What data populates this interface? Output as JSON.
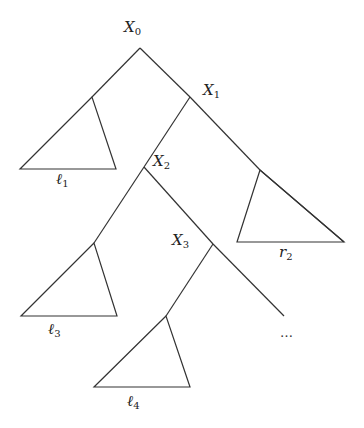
{
  "diagram": {
    "type": "tree",
    "stroke_color": "#333333",
    "nodes": [
      {
        "id": "X0",
        "base": "X",
        "sub": "0",
        "x": 140,
        "y": 48,
        "label_x": 124,
        "label_y": 20
      },
      {
        "id": "X1",
        "base": "X",
        "sub": "1",
        "x": 190,
        "y": 97,
        "label_x": 203,
        "label_y": 83
      },
      {
        "id": "X2",
        "base": "X",
        "sub": "2",
        "x": 144,
        "y": 167,
        "label_x": 153,
        "label_y": 154
      },
      {
        "id": "X3",
        "base": "X",
        "sub": "3",
        "x": 213,
        "y": 244,
        "label_x": 172,
        "label_y": 233
      }
    ],
    "subtrees": [
      {
        "id": "l1",
        "base": "ℓ",
        "sub": "1",
        "apex": [
          92,
          97
        ],
        "left": [
          20,
          169
        ],
        "right": [
          116,
          169
        ],
        "label_x": 56,
        "label_y": 172
      },
      {
        "id": "r2",
        "base": "r",
        "sub": "2",
        "apex": [
          260,
          170
        ],
        "left": [
          237,
          242
        ],
        "right": [
          344,
          242
        ],
        "label_x": 279,
        "label_y": 245
      },
      {
        "id": "l3",
        "base": "ℓ",
        "sub": "3",
        "apex": [
          94,
          243
        ],
        "left": [
          21,
          316
        ],
        "right": [
          117,
          316
        ],
        "label_x": 48,
        "label_y": 322
      },
      {
        "id": "l4",
        "base": "ℓ",
        "sub": "4",
        "apex": [
          166,
          316
        ],
        "left": [
          94,
          387
        ],
        "right": [
          190,
          387
        ],
        "label_x": 127,
        "label_y": 394
      }
    ],
    "continuation": {
      "text": "…",
      "x": 280,
      "y": 325
    },
    "edges": [
      [
        [
          140,
          48
        ],
        [
          92,
          97
        ]
      ],
      [
        [
          140,
          48
        ],
        [
          190,
          97
        ]
      ],
      [
        [
          190,
          97
        ],
        [
          260,
          170
        ]
      ],
      [
        [
          260,
          170
        ],
        [
          344,
          242
        ]
      ],
      [
        [
          190,
          97
        ],
        [
          144,
          167
        ]
      ],
      [
        [
          144,
          167
        ],
        [
          94,
          243
        ]
      ],
      [
        [
          144,
          167
        ],
        [
          213,
          244
        ]
      ],
      [
        [
          213,
          244
        ],
        [
          284,
          316
        ]
      ],
      [
        [
          213,
          244
        ],
        [
          166,
          316
        ]
      ]
    ]
  }
}
